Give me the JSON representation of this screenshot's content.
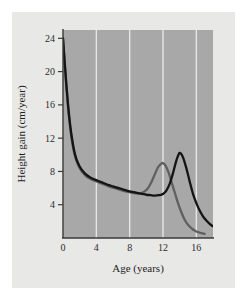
{
  "figure": {
    "background_color": "#e8e8e6",
    "outer_background_color": "#ffffff",
    "plot_background_color": "#a8a8a8",
    "gridline_color": "#e6e6e6",
    "axis_color": "#3a3a3a"
  },
  "chart_data": {
    "type": "line",
    "title": "",
    "xlabel": "Age (years)",
    "ylabel": "Height gain (cm/year)",
    "xlim": [
      0,
      18
    ],
    "ylim": [
      0,
      25
    ],
    "xticks": [
      0,
      4,
      8,
      12,
      16
    ],
    "yticks": [
      4,
      8,
      12,
      16,
      20,
      24
    ],
    "xtick_labels": [
      "0",
      "4",
      "8",
      "12",
      "16"
    ],
    "ytick_labels": [
      "4",
      "8",
      "12",
      "16",
      "20",
      "24"
    ],
    "grid": "vertical-only",
    "legend": "none",
    "series": [
      {
        "name": "girls",
        "color": "#606060",
        "peak_age": 12.0,
        "peak_value": 9.0,
        "points": [
          [
            0.0,
            24.0
          ],
          [
            0.2,
            21.0
          ],
          [
            0.4,
            18.2
          ],
          [
            0.6,
            15.8
          ],
          [
            0.8,
            13.8
          ],
          [
            1.0,
            12.2
          ],
          [
            1.3,
            10.4
          ],
          [
            1.6,
            9.3
          ],
          [
            2.0,
            8.4
          ],
          [
            2.5,
            7.7
          ],
          [
            3.0,
            7.25
          ],
          [
            3.5,
            7.0
          ],
          [
            4.0,
            6.8
          ],
          [
            4.5,
            6.6
          ],
          [
            5.0,
            6.4
          ],
          [
            5.5,
            6.2
          ],
          [
            6.0,
            6.05
          ],
          [
            6.5,
            5.9
          ],
          [
            7.0,
            5.75
          ],
          [
            7.5,
            5.6
          ],
          [
            8.0,
            5.5
          ],
          [
            8.5,
            5.4
          ],
          [
            9.0,
            5.35
          ],
          [
            9.4,
            5.4
          ],
          [
            9.8,
            5.6
          ],
          [
            10.2,
            6.0
          ],
          [
            10.6,
            6.7
          ],
          [
            11.0,
            7.6
          ],
          [
            11.4,
            8.5
          ],
          [
            11.8,
            8.95
          ],
          [
            12.0,
            9.0
          ],
          [
            12.3,
            8.7
          ],
          [
            12.7,
            7.8
          ],
          [
            13.0,
            6.8
          ],
          [
            13.4,
            5.5
          ],
          [
            13.8,
            4.2
          ],
          [
            14.2,
            3.1
          ],
          [
            14.6,
            2.2
          ],
          [
            15.0,
            1.6
          ],
          [
            15.4,
            1.2
          ],
          [
            15.8,
            0.9
          ],
          [
            16.2,
            0.7
          ],
          [
            16.6,
            0.6
          ],
          [
            17.0,
            0.5
          ]
        ]
      },
      {
        "name": "boys",
        "color": "#141414",
        "peak_age": 14.0,
        "peak_value": 10.2,
        "points": [
          [
            0.0,
            24.0
          ],
          [
            0.2,
            21.2
          ],
          [
            0.4,
            18.5
          ],
          [
            0.6,
            16.1
          ],
          [
            0.8,
            14.1
          ],
          [
            1.0,
            12.5
          ],
          [
            1.3,
            10.7
          ],
          [
            1.6,
            9.5
          ],
          [
            2.0,
            8.6
          ],
          [
            2.5,
            7.9
          ],
          [
            3.0,
            7.45
          ],
          [
            3.5,
            7.15
          ],
          [
            4.0,
            6.95
          ],
          [
            4.5,
            6.75
          ],
          [
            5.0,
            6.55
          ],
          [
            5.5,
            6.35
          ],
          [
            6.0,
            6.2
          ],
          [
            6.5,
            6.05
          ],
          [
            7.0,
            5.9
          ],
          [
            7.5,
            5.75
          ],
          [
            8.0,
            5.6
          ],
          [
            8.5,
            5.5
          ],
          [
            9.0,
            5.4
          ],
          [
            9.5,
            5.3
          ],
          [
            10.0,
            5.2
          ],
          [
            10.5,
            5.15
          ],
          [
            11.0,
            5.1
          ],
          [
            11.5,
            5.15
          ],
          [
            12.0,
            5.3
          ],
          [
            12.4,
            5.7
          ],
          [
            12.8,
            6.5
          ],
          [
            13.2,
            7.8
          ],
          [
            13.6,
            9.3
          ],
          [
            13.9,
            10.1
          ],
          [
            14.1,
            10.2
          ],
          [
            14.4,
            9.7
          ],
          [
            14.8,
            8.4
          ],
          [
            15.2,
            6.8
          ],
          [
            15.6,
            5.3
          ],
          [
            16.0,
            4.2
          ],
          [
            16.4,
            3.3
          ],
          [
            16.8,
            2.6
          ],
          [
            17.2,
            2.1
          ],
          [
            17.6,
            1.7
          ],
          [
            18.0,
            1.4
          ]
        ]
      }
    ]
  }
}
